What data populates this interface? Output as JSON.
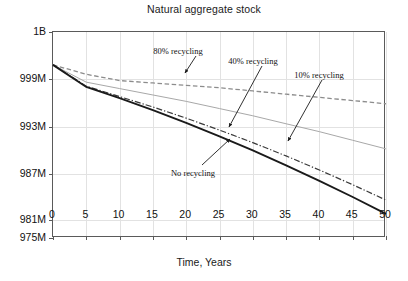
{
  "chart_data": {
    "type": "line",
    "title": "Natural aggregate stock",
    "xlabel": "Time, Years",
    "ylabel": "",
    "xlim": [
      0,
      50
    ],
    "ylim": [
      975,
      1000
    ],
    "grid": true,
    "legend": "none (inline annotations with arrows)",
    "x_ticks": [
      "0",
      "5",
      "10",
      "15",
      "20",
      "25",
      "30",
      "35",
      "40",
      "45",
      "50"
    ],
    "x_tick_values": [
      0,
      5,
      10,
      15,
      20,
      25,
      30,
      35,
      40,
      45,
      50
    ],
    "y_ticks": [
      "1B",
      "999M",
      "993M",
      "987M",
      "981M",
      "975M"
    ],
    "y_tick_values": [
      1000,
      999,
      993,
      987,
      981,
      975
    ],
    "y_tick_positions_pct": [
      0,
      22.8,
      46.1,
      68.9,
      91.3,
      100
    ],
    "units": "aggregate stock (tonnes), 1B = 1000M",
    "x": [
      0,
      5,
      10,
      15,
      20,
      25,
      30,
      35,
      40,
      45,
      50
    ],
    "series": [
      {
        "name": "80% recycling",
        "style": "dashed",
        "color": "#8c8c8c",
        "width": 1.3,
        "values": [
          999.3,
          999.1,
          998.8,
          998.5,
          998.2,
          997.9,
          997.5,
          997.1,
          996.7,
          996.3,
          995.9
        ]
      },
      {
        "name": "40% recycling",
        "style": "solid-thin",
        "color": "#a8a8a8",
        "width": 1.0,
        "values": [
          999.3,
          998.6,
          997.8,
          997.0,
          996.2,
          995.3,
          994.4,
          993.4,
          992.4,
          991.3,
          990.2
        ]
      },
      {
        "name": "10% recycling",
        "style": "dash-dot",
        "color": "#3a3a3a",
        "width": 1.2,
        "values": [
          999.3,
          998.1,
          996.8,
          995.5,
          994.1,
          992.6,
          991.0,
          989.3,
          987.5,
          985.6,
          983.6
        ]
      },
      {
        "name": "No recycling",
        "style": "solid-thick",
        "color": "#1a1a1a",
        "width": 1.9,
        "values": [
          999.3,
          998.0,
          996.6,
          995.1,
          993.5,
          991.8,
          990.0,
          988.1,
          986.1,
          984.0,
          981.8
        ]
      }
    ],
    "annotations": [
      {
        "text": "80% recycling",
        "label_x_px": 178,
        "label_y_px": 46,
        "arrow_from_px": [
          196,
          56
        ],
        "arrow_to_px": [
          185,
          73
        ]
      },
      {
        "text": "40% recycling",
        "label_x_px": 253,
        "label_y_px": 56,
        "arrow_from_px": [
          262,
          66
        ],
        "arrow_to_px": [
          229,
          127
        ]
      },
      {
        "text": "10% recycling",
        "label_x_px": 319,
        "label_y_px": 70,
        "arrow_from_px": [
          322,
          80
        ],
        "arrow_to_px": [
          288,
          141
        ]
      },
      {
        "text": "No recycling",
        "label_x_px": 193,
        "label_y_px": 168,
        "arrow_from_px": [
          202,
          165
        ],
        "arrow_to_px": [
          230,
          139
        ]
      }
    ]
  }
}
